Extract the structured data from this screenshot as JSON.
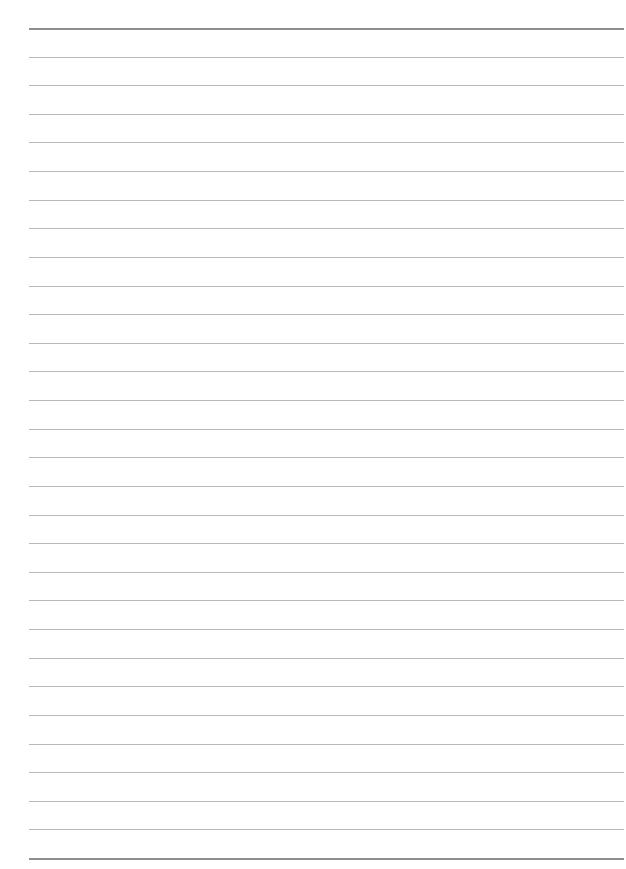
{
  "page": {
    "type": "ruled-sheet",
    "background": "#ffffff",
    "rule_color": "#b9b9b9",
    "heavy_rule_color": "#8f8f8f",
    "rules": {
      "count": 30,
      "first_y": 28,
      "last_y": 858,
      "left_x": 29,
      "right_x": 624,
      "heavy_indices": [
        0,
        29
      ]
    },
    "text_content": []
  }
}
